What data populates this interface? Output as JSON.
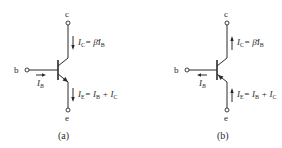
{
  "figure": {
    "circuits": [
      {
        "id": "a",
        "type": "NPN",
        "caption": "(a)",
        "terminals": {
          "collector": "c",
          "base": "b",
          "emitter": "e"
        },
        "currents": {
          "base": {
            "symbol": "I",
            "sub": "B",
            "direction": "into base"
          },
          "collector": {
            "lhs": "I",
            "lhs_sub": "C",
            "rhs": "= β̄I",
            "rhs_sub": "B",
            "direction": "into collector (downward)"
          },
          "emitter": {
            "lhs": "I",
            "lhs_sub": "E",
            "rhs1": "= I",
            "rhs1_sub": "B",
            "rhs2": " + I",
            "rhs2_sub": "C",
            "direction": "out of emitter (downward)"
          }
        }
      },
      {
        "id": "b",
        "type": "PNP",
        "caption": "(b)",
        "terminals": {
          "collector": "c",
          "base": "b",
          "emitter": "e"
        },
        "currents": {
          "base": {
            "symbol": "I",
            "sub": "B",
            "direction": "out of base"
          },
          "collector": {
            "lhs": "I",
            "lhs_sub": "C",
            "rhs": "= β̄I",
            "rhs_sub": "B",
            "direction": "out of collector (upward)"
          },
          "emitter": {
            "lhs": "I",
            "lhs_sub": "E",
            "rhs1": "= I",
            "rhs1_sub": "B",
            "rhs2": " + I",
            "rhs2_sub": "C",
            "direction": "into emitter (upward)"
          }
        }
      }
    ],
    "colors": {
      "ink": "#2a2a2a",
      "background": "#ffffff"
    }
  }
}
